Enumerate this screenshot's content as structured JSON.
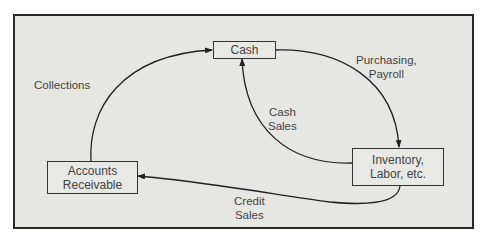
{
  "diagram": {
    "type": "cash-cycle-flow",
    "colors": {
      "background": "#e6e6e3",
      "border": "#2a2a2a",
      "text": "#444444"
    },
    "nodes": {
      "cash": {
        "label": "Cash"
      },
      "inventory": {
        "line1": "Inventory,",
        "line2": "Labor, etc."
      },
      "receivable": {
        "line1": "Accounts",
        "line2": "Receivable"
      }
    },
    "edges": {
      "purchasing": {
        "line1": "Purchasing,",
        "line2": "Payroll",
        "from": "Cash",
        "to": "Inventory, Labor, etc."
      },
      "cash_sales": {
        "line1": "Cash",
        "line2": "Sales",
        "from": "Inventory, Labor, etc.",
        "to": "Cash"
      },
      "credit_sales": {
        "line1": "Credit",
        "line2": "Sales",
        "from": "Inventory, Labor, etc.",
        "to": "Accounts Receivable"
      },
      "collections": {
        "label": "Collections",
        "from": "Accounts Receivable",
        "to": "Cash"
      }
    }
  }
}
